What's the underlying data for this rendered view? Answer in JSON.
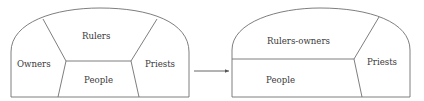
{
  "diagram": {
    "before": {
      "labels": {
        "rulers": "Rulers",
        "owners": "Owners",
        "priests": "Priests",
        "people": "People"
      }
    },
    "after": {
      "labels": {
        "rulers_owners": "Rulers-owners",
        "people": "People",
        "priests": "Priests"
      }
    },
    "arrow": "transition-arrow"
  },
  "colors": {
    "stroke": "#6f6f6f",
    "text": "#3a3a3a",
    "background": "#ffffff"
  }
}
